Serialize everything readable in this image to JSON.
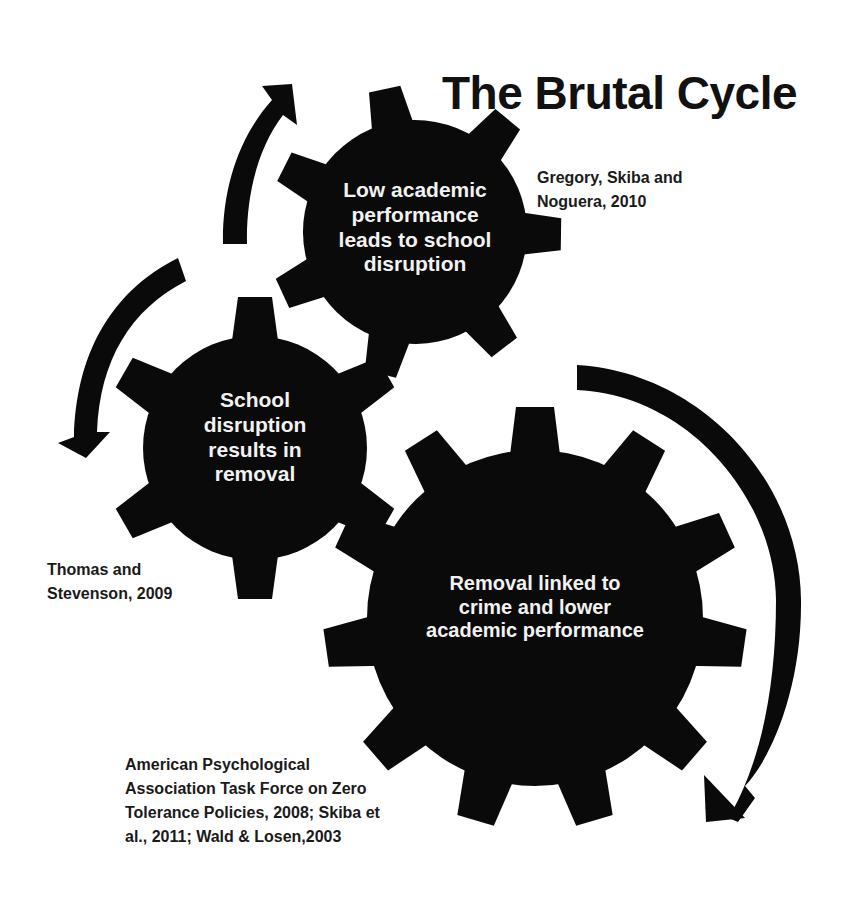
{
  "title": "The Brutal Cycle",
  "colors": {
    "gear": "#0a0a0a",
    "gear_text": "#f2f2f2",
    "text": "#1a1a1a",
    "background": "#ffffff"
  },
  "gears": [
    {
      "id": "top",
      "lines": [
        "Low academic",
        "performance",
        "leads to school",
        "disruption"
      ],
      "teeth": 7
    },
    {
      "id": "middle",
      "lines": [
        "School",
        "disruption",
        "results in",
        "removal"
      ],
      "teeth": 6
    },
    {
      "id": "large",
      "lines": [
        "Removal linked to",
        "crime and lower",
        "academic performance"
      ],
      "teeth": 11
    }
  ],
  "citations": [
    {
      "id": "top",
      "lines": [
        "Gregory, Skiba and",
        "Noguera, 2010"
      ]
    },
    {
      "id": "middle",
      "lines": [
        "Thomas and",
        "Stevenson, 2009"
      ]
    },
    {
      "id": "large",
      "lines": [
        "American Psychological",
        "Association Task Force on Zero",
        "Tolerance Policies, 2008; Skiba et",
        "al., 2011; Wald & Losen,2003"
      ]
    }
  ],
  "arrows": [
    {
      "id": "up-arrow",
      "icon": "curved-arrow-up-icon"
    },
    {
      "id": "left-down-arrow",
      "icon": "curved-arrow-down-left-icon"
    },
    {
      "id": "right-down-arrow",
      "icon": "curved-arrow-down-right-icon"
    }
  ]
}
